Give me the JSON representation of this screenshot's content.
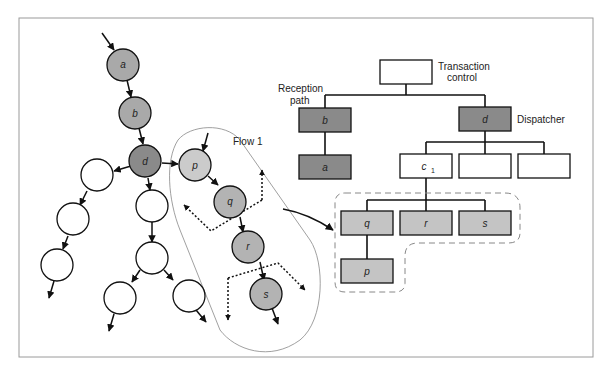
{
  "colors": {
    "dark_gray": "#8a8a8a",
    "mid_gray": "#a9a9a9",
    "light_gray": "#cbcbcb",
    "white": "#ffffff",
    "stroke": "#111111",
    "frame": "#999999"
  },
  "left_graph": {
    "nodes": [
      {
        "id": "a",
        "label": "a",
        "fill": "mid"
      },
      {
        "id": "b",
        "label": "b",
        "fill": "mid"
      },
      {
        "id": "d",
        "label": "d",
        "fill": "dark"
      },
      {
        "id": "p",
        "label": "p",
        "fill": "light"
      },
      {
        "id": "q",
        "label": "q",
        "fill": "mid"
      },
      {
        "id": "r",
        "label": "r",
        "fill": "mid"
      },
      {
        "id": "s",
        "label": "s",
        "fill": "mid"
      }
    ],
    "flow_label": "Flow 1"
  },
  "tree": {
    "root_caption_line1": "Transaction",
    "root_caption_line2": "control",
    "reception_caption_line1": "Reception",
    "reception_caption_line2": "path",
    "dispatcher_caption": "Dispatcher",
    "boxes": {
      "b": "b",
      "a": "a",
      "d": "d",
      "c1": "c",
      "c1_sub": "1",
      "q": "q",
      "r": "r",
      "s": "s",
      "p": "p"
    }
  }
}
